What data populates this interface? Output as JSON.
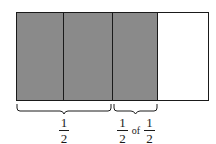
{
  "diagram": {
    "background_color": "#ffffff",
    "outline_color": "#1a1a1a",
    "shaded_color": "#8a8a8a",
    "unshaded_color": "#ffffff",
    "bar": {
      "total_parts": 4,
      "shaded_parts": 3,
      "cells": [
        {
          "index": 1,
          "state": "shaded",
          "fill": "#8a8a8a"
        },
        {
          "index": 2,
          "state": "shaded",
          "fill": "#8a8a8a"
        },
        {
          "index": 3,
          "state": "shaded",
          "fill": "#8a8a8a"
        },
        {
          "index": 4,
          "state": "unshaded",
          "fill": "#ffffff"
        }
      ]
    },
    "braces": [
      {
        "name": "left-brace",
        "spans_cells": [
          1,
          2
        ],
        "label": {
          "type": "fraction",
          "numerator": "1",
          "denominator": "2",
          "text": "1/2"
        }
      },
      {
        "name": "right-brace",
        "spans_cells": [
          3
        ],
        "label": {
          "type": "fraction-expression",
          "first": {
            "numerator": "1",
            "denominator": "2"
          },
          "operator": "of",
          "second": {
            "numerator": "1",
            "denominator": "2"
          },
          "text": "1/2 of 1/2"
        }
      }
    ]
  }
}
